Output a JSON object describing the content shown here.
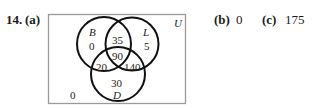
{
  "problem": {
    "number": "14.",
    "part_a_label": "(a)",
    "part_b_label": "(b)",
    "part_b_answer": "0",
    "part_c_label": "(c)",
    "part_c_answer": "175"
  },
  "venn": {
    "universe_label": "U",
    "sets": [
      {
        "label": "B",
        "only": "0"
      },
      {
        "label": "L",
        "only": "5"
      },
      {
        "label": "D",
        "only": "30"
      }
    ],
    "regions": {
      "B_only": "0",
      "L_only": "5",
      "D_only": "30",
      "B_and_L_only": "35",
      "B_and_D_only": "20",
      "L_and_D_only": "140",
      "B_L_D": "90",
      "outside": "0"
    },
    "colors": {
      "circle_stroke": "#111111",
      "box_stroke": "#9a9a9a"
    }
  }
}
